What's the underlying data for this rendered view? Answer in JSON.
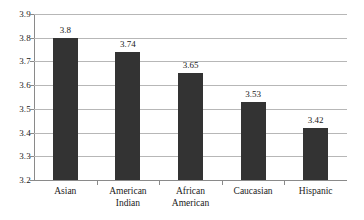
{
  "chart_data": {
    "type": "bar",
    "title": "",
    "subtitle": "",
    "xlabel": "",
    "ylabel": "",
    "categories": [
      "Asian",
      "American Indian",
      "African American",
      "Caucasian",
      "Hispanic"
    ],
    "category_lines": [
      [
        "Asian"
      ],
      [
        "American",
        "Indian"
      ],
      [
        "African",
        "American"
      ],
      [
        "Caucasian"
      ],
      [
        "Hispanic"
      ]
    ],
    "values": [
      3.8,
      3.74,
      3.65,
      3.53,
      3.42
    ],
    "value_labels": [
      "3.8",
      "3.74",
      "3.65",
      "3.53",
      "3.42"
    ],
    "ylim": [
      3.2,
      3.9
    ],
    "ytick_step": 0.1,
    "ytick_labels": [
      "3.9",
      "3.8",
      "3.7",
      "3.6",
      "3.5",
      "3.4",
      "3.3",
      "3.2"
    ],
    "ytick_values": [
      3.9,
      3.8,
      3.7,
      3.6,
      3.5,
      3.4,
      3.3,
      3.2
    ],
    "grid": true,
    "grid_orientation": "horizontal",
    "legend": false,
    "legend_position": "none",
    "bar_color": "#333333",
    "grid_color": "#b7b7b7",
    "axis_color": "#8a8a8a",
    "text_color": "#1a1a1a",
    "background_color": "#ffffff"
  }
}
